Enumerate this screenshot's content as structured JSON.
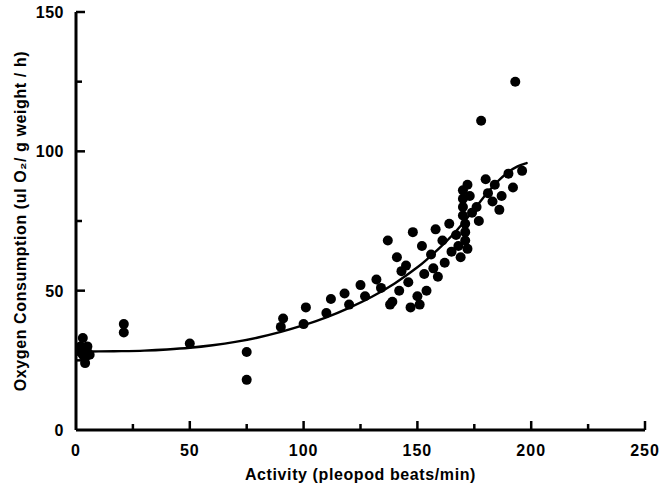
{
  "chart_data": {
    "type": "scatter",
    "title": "",
    "xlabel": "Activity (pleopod beats/min)",
    "ylabel": "Oxygen Consumption (ul O₂/ g weight / h)",
    "xlim": [
      0,
      250
    ],
    "ylim": [
      0,
      150
    ],
    "x_major_ticks": [
      0,
      50,
      100,
      150,
      200,
      250
    ],
    "x_minor_ticks": [
      25,
      75,
      125,
      175,
      225
    ],
    "y_major_ticks": [
      0,
      50,
      100,
      150
    ],
    "y_minor_ticks": [
      25,
      75,
      125
    ],
    "x_tick_labels": [
      "0",
      "50",
      "100",
      "150",
      "200",
      "250"
    ],
    "y_tick_labels": [
      "0",
      "50",
      "100",
      "150"
    ],
    "grid": false,
    "legend": false,
    "tick_direction": "in",
    "marker": "filled-circle",
    "marker_color": "#000000",
    "marker_size": 5,
    "line_color": "#000000",
    "line_width": 2.4,
    "series": [
      {
        "name": "Oxygen consumption vs activity",
        "points": [
          [
            2,
            30
          ],
          [
            2,
            28
          ],
          [
            3,
            29
          ],
          [
            3,
            27
          ],
          [
            4,
            26
          ],
          [
            3,
            33
          ],
          [
            4,
            24
          ],
          [
            5,
            28
          ],
          [
            5,
            30
          ],
          [
            6,
            27
          ],
          [
            21,
            38
          ],
          [
            21,
            35
          ],
          [
            50,
            31
          ],
          [
            75,
            28
          ],
          [
            75,
            18
          ],
          [
            90,
            37
          ],
          [
            91,
            40
          ],
          [
            100,
            38
          ],
          [
            101,
            44
          ],
          [
            110,
            42
          ],
          [
            112,
            47
          ],
          [
            118,
            49
          ],
          [
            120,
            45
          ],
          [
            125,
            52
          ],
          [
            127,
            48
          ],
          [
            132,
            54
          ],
          [
            134,
            51
          ],
          [
            137,
            68
          ],
          [
            138,
            45
          ],
          [
            139,
            46
          ],
          [
            141,
            62
          ],
          [
            142,
            50
          ],
          [
            143,
            57
          ],
          [
            145,
            59
          ],
          [
            146,
            53
          ],
          [
            147,
            44
          ],
          [
            148,
            71
          ],
          [
            150,
            48
          ],
          [
            151,
            45
          ],
          [
            152,
            66
          ],
          [
            153,
            56
          ],
          [
            154,
            50
          ],
          [
            156,
            63
          ],
          [
            157,
            58
          ],
          [
            158,
            72
          ],
          [
            159,
            55
          ],
          [
            161,
            68
          ],
          [
            162,
            60
          ],
          [
            164,
            74
          ],
          [
            165,
            64
          ],
          [
            167,
            70
          ],
          [
            168,
            66
          ],
          [
            169,
            62
          ],
          [
            170,
            86
          ],
          [
            170,
            83
          ],
          [
            170,
            80
          ],
          [
            170,
            77
          ],
          [
            171,
            74
          ],
          [
            171,
            71
          ],
          [
            171,
            68
          ],
          [
            172,
            88
          ],
          [
            172,
            65
          ],
          [
            173,
            84
          ],
          [
            174,
            78
          ],
          [
            176,
            80
          ],
          [
            177,
            75
          ],
          [
            178,
            111
          ],
          [
            180,
            90
          ],
          [
            181,
            85
          ],
          [
            183,
            82
          ],
          [
            184,
            88
          ],
          [
            186,
            79
          ],
          [
            187,
            84
          ],
          [
            190,
            92
          ],
          [
            192,
            87
          ],
          [
            193,
            125
          ],
          [
            196,
            93
          ]
        ]
      }
    ],
    "fit_curve": {
      "name": "fitted exponential curve",
      "points": [
        [
          1,
          28.2
        ],
        [
          10,
          28.2
        ],
        [
          20,
          28.3
        ],
        [
          30,
          28.5
        ],
        [
          40,
          28.9
        ],
        [
          50,
          29.5
        ],
        [
          60,
          30.4
        ],
        [
          70,
          31.6
        ],
        [
          80,
          33.2
        ],
        [
          90,
          35.2
        ],
        [
          100,
          37.6
        ],
        [
          110,
          40.4
        ],
        [
          120,
          43.8
        ],
        [
          130,
          47.8
        ],
        [
          140,
          52.6
        ],
        [
          150,
          58.4
        ],
        [
          155,
          61.8
        ],
        [
          160,
          65.5
        ],
        [
          165,
          69.6
        ],
        [
          170,
          74.2
        ],
        [
          175,
          79.2
        ],
        [
          180,
          84.4
        ],
        [
          185,
          89.0
        ],
        [
          190,
          92.6
        ],
        [
          194,
          94.6
        ],
        [
          198,
          95.8
        ]
      ]
    }
  },
  "figure": {
    "background_color": "#ffffff",
    "axis_color": "#000000",
    "text_color": "#000000"
  }
}
